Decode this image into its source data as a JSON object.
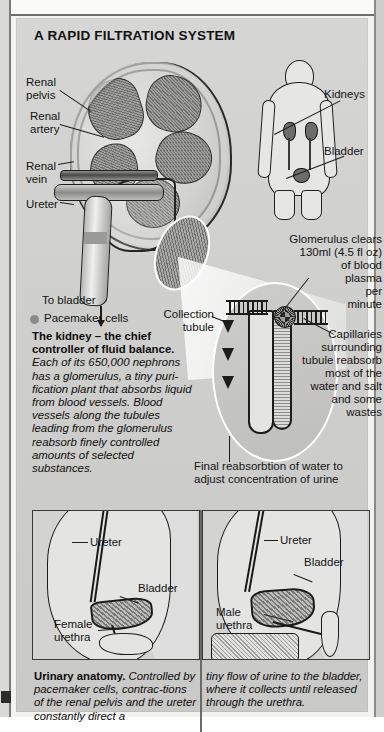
{
  "title": "A RAPID FILTRATION SYSTEM",
  "kidney_labels": {
    "renal_pelvis": "Renal\npelvis",
    "renal_artery": "Renal\nartery",
    "renal_vein": "Renal\nvein",
    "ureter": "Ureter",
    "to_bladder": "To bladder",
    "pacemaker_cells": "Pacemaker cells"
  },
  "human_labels": {
    "kidneys": "Kidneys",
    "bladder": "Bladder"
  },
  "nephron_labels": {
    "glomerulus_note": "Glomerulus clears\n130ml (4.5 fl oz)\nof blood\nplasma\nper\nminute",
    "collection_tubule": "Collection\ntubule",
    "capillaries_note": "Capillaries\nsurrounding\ntubule reabsorb\nmost of the\nwater and salt\nand some\nwastes",
    "final_reabsorption": "Final reabsorbtion of water to\nadjust concentration of urine"
  },
  "kidney_caption": {
    "lead": "The kidney – the chief controller of fluid balance",
    "period": ".",
    "body": "Each of its 650,000 nephrons has a glomerulus, a tiny puri-fication plant that absorbs liquid from blood vessels. Blood vessels along the tubules leading from the glomerulus reabsorb finely controlled amounts of selected substances."
  },
  "female_diagram": {
    "ureter": "Ureter",
    "bladder": "Bladder",
    "urethra": "Female\nurethra"
  },
  "male_diagram": {
    "ureter": "Ureter",
    "bladder": "Bladder",
    "urethra": "Male\nurethra"
  },
  "bottom_caption": {
    "lead": "Urinary anatomy",
    "period": ".",
    "left_body": "Controlled by pacemaker cells, contrac-tions of the renal pelvis and the ureter constantly direct a",
    "right_body": "tiny flow of urine to the bladder, where it collects until released through the urethra."
  },
  "colors": {
    "page_bg": "#f2f2f0",
    "panel_bg": "#d2d2d0",
    "ink": "#141414",
    "organ_fill": "#6d6d6b",
    "bullet": "#8c8c8a"
  }
}
